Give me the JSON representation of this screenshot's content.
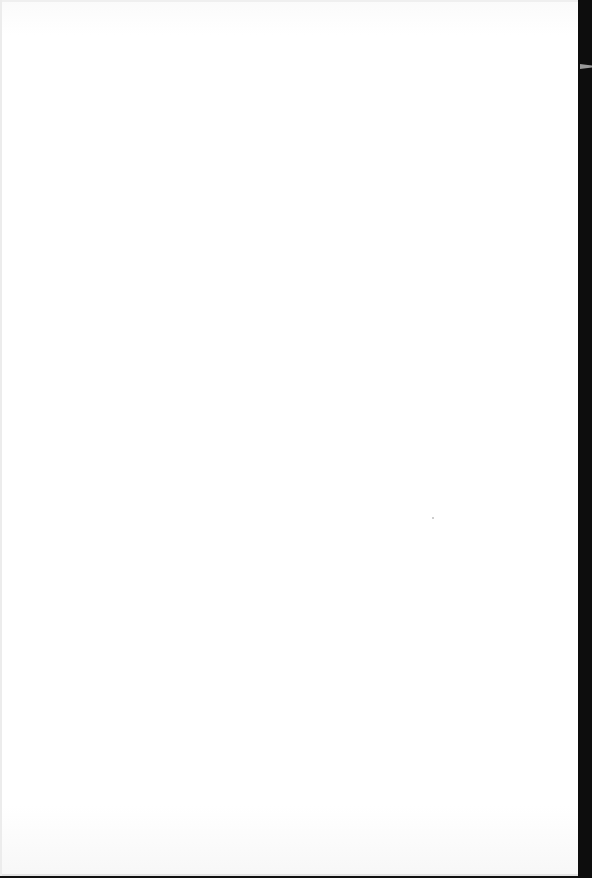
{
  "document": {
    "type": "blank page",
    "content": []
  }
}
